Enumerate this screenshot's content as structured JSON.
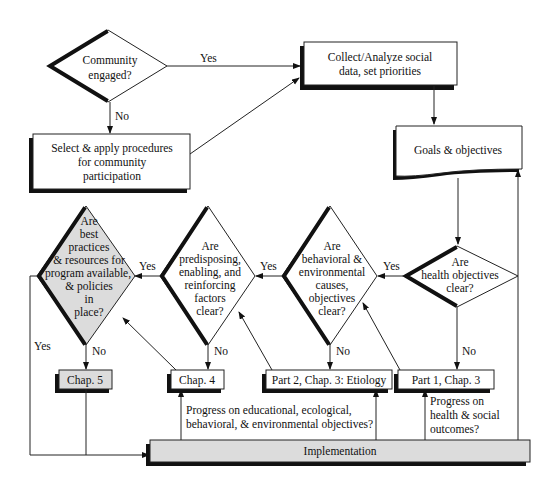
{
  "nodes": {
    "community": {
      "lines": [
        "Community",
        "engaged?"
      ]
    },
    "select": {
      "lines": [
        "Select & apply procedures",
        "for community",
        "participation"
      ]
    },
    "collect": {
      "lines": [
        "Collect/Analyze social",
        "data, set priorities"
      ]
    },
    "goals": {
      "lines": [
        "Goals & objectives"
      ]
    },
    "health": {
      "lines": [
        "Are",
        "health objectives",
        "clear?"
      ]
    },
    "behavioral": {
      "lines": [
        "Are",
        "behavioral &",
        "environmental",
        "causes,",
        "objectives",
        "clear?"
      ]
    },
    "predisposing": {
      "lines": [
        "Are",
        "predisposing,",
        "enabling, and",
        "reinforcing",
        "factors",
        "clear?"
      ]
    },
    "best": {
      "lines": [
        "Are",
        "best",
        "practices",
        "& resources for",
        "program available,",
        "& policies",
        "in",
        "place?"
      ]
    },
    "chap5": {
      "label": "Chap. 5"
    },
    "chap4": {
      "label": "Chap. 4"
    },
    "part2": {
      "label": "Part 2, Chap. 3: Etiology"
    },
    "part1": {
      "label": "Part 1, Chap. 3"
    },
    "implementation": {
      "label": "Implementation"
    }
  },
  "edge_labels": {
    "community_yes": "Yes",
    "community_no": "No",
    "health_yes": "Yes",
    "health_no": "No",
    "behavioral_yes": "Yes",
    "behavioral_no": "No",
    "predisposing_yes": "Yes",
    "predisposing_no": "No",
    "best_yes": "Yes",
    "best_no": "No"
  },
  "annotations": {
    "progress_edu": [
      "Progress on educational, ecological,",
      "behavioral, & environmental objectives?"
    ],
    "progress_health": [
      "Progress on",
      "health & social",
      "outcomes?"
    ]
  },
  "colors": {
    "shade": "#dcdcdc",
    "line": "#222222",
    "shadow": "#111111"
  }
}
